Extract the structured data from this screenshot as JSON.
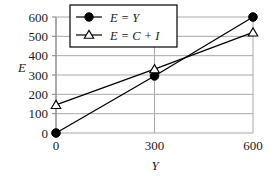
{
  "chart_data": {
    "type": "line",
    "title": "",
    "xlabel": "Y",
    "ylabel": "E",
    "xlim": [
      0,
      600
    ],
    "ylim": [
      0,
      600
    ],
    "xticks": [
      0,
      300,
      600
    ],
    "xtick_labels": [
      "0",
      "300",
      "600"
    ],
    "yticks": [
      0,
      100,
      200,
      300,
      400,
      500,
      600
    ],
    "ytick_labels": [
      "0",
      "100",
      "200",
      "300",
      "400",
      "500",
      "600"
    ],
    "grid": true,
    "grid_axis": "y",
    "legend_position": "upper-left",
    "x": [
      0,
      300,
      600
    ],
    "series": [
      {
        "name": "E = Y",
        "marker": "filled-circle",
        "values": [
          0,
          295,
          600
        ]
      },
      {
        "name": "E = C + I",
        "marker": "open-triangle",
        "values": [
          145,
          330,
          520
        ]
      }
    ]
  },
  "legend": {
    "entries": [
      {
        "label": "E = Y",
        "marker": "filled-circle-marker"
      },
      {
        "label": "E = C + I",
        "marker": "open-triangle-marker"
      }
    ]
  },
  "colors": {
    "line": "#000000",
    "grid": "#a8a8a8",
    "axis": "#8a8a8a",
    "marker_fill": "#000000",
    "marker_open_fill": "#ffffff",
    "legend_border": "#000000",
    "legend_background": "#ffffff",
    "background": "#ffffff"
  }
}
